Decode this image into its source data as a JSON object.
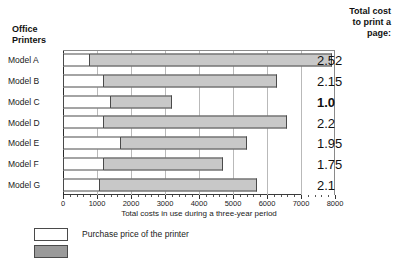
{
  "headers": {
    "left_line1": "Office",
    "left_line2": "Printers",
    "right_line1": "Total cost",
    "right_line2": "to print a",
    "right_line3": "page:"
  },
  "chart_data": {
    "type": "bar",
    "orientation": "horizontal",
    "stacked": true,
    "title": "",
    "xlabel": "Total costs in use during a three-year period",
    "ylabel": "Office Printers",
    "xlim": [
      0,
      8000
    ],
    "xticks": [
      0,
      1000,
      2000,
      3000,
      4000,
      5000,
      6000,
      7000,
      8000
    ],
    "xticklabels": [
      "0",
      "1000",
      "2000",
      "3000",
      "4000",
      "5000",
      "6000",
      "7000",
      "8000"
    ],
    "grid": true,
    "grid_axis": "x",
    "legend_position": "below",
    "categories": [
      "Model A",
      "Model B",
      "Model C",
      "Model D",
      "Model E",
      "Model F",
      "Model G"
    ],
    "series": [
      {
        "name": "Purchase price of the printer",
        "color": "#ffffff",
        "values": [
          800,
          1200,
          1400,
          1200,
          1700,
          1200,
          1100
        ]
      },
      {
        "name": "Other costs in use during a three-year period",
        "color": "#c8c8c8",
        "values": [
          7100,
          5100,
          1800,
          5400,
          3700,
          3500,
          4600
        ]
      }
    ],
    "totals": [
      7900,
      6300,
      3200,
      6600,
      5400,
      4700,
      5700
    ],
    "annotations": {
      "label": "Total cost to print a page:",
      "values": [
        "2.52",
        "2.15",
        "1.0",
        "2.2",
        "1.95",
        "1.75",
        "2.1"
      ],
      "emphasized_index": 2
    }
  },
  "legend": {
    "items": [
      {
        "label": "Purchase price of the printer",
        "color": "#ffffff"
      },
      {
        "label": "",
        "color": "#9a9a9a"
      }
    ]
  },
  "colors": {
    "purchase_fill": "#ffffff",
    "usage_fill": "#c8c8c8",
    "bar_outline": "#4a4a4a",
    "grid": "#b9b9b9",
    "axis": "#2a2a2a",
    "text": "#1a1a1a"
  }
}
